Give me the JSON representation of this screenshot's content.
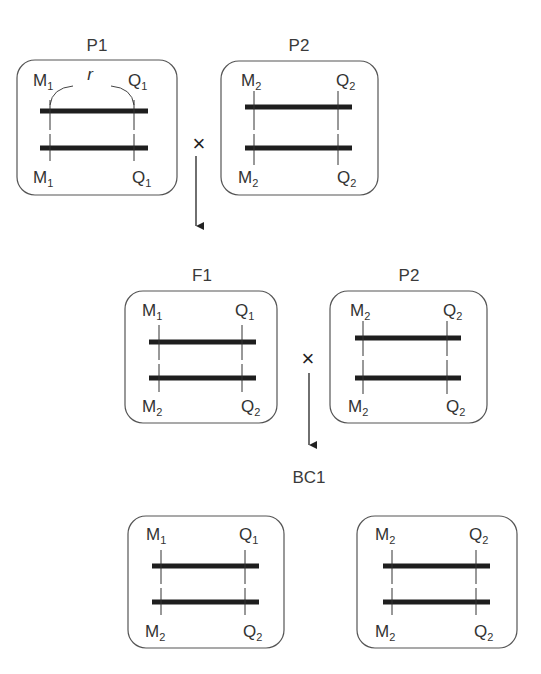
{
  "diagram": {
    "type": "genetic-cross-backcross",
    "cross_symbol": "×",
    "generations": [
      {
        "row": 1,
        "cross": true,
        "individuals": [
          {
            "title": "P1",
            "top_left": {
              "base": "M",
              "sub": "1"
            },
            "top_right": {
              "base": "Q",
              "sub": "1"
            },
            "bottom_left": {
              "base": "M",
              "sub": "1"
            },
            "bottom_right": {
              "base": "Q",
              "sub": "1"
            },
            "recombination_label": "r"
          },
          {
            "title": "P2",
            "top_left": {
              "base": "M",
              "sub": "2"
            },
            "top_right": {
              "base": "Q",
              "sub": "2"
            },
            "bottom_left": {
              "base": "M",
              "sub": "2"
            },
            "bottom_right": {
              "base": "Q",
              "sub": "2"
            }
          }
        ]
      },
      {
        "row": 2,
        "cross": true,
        "individuals": [
          {
            "title": "F1",
            "top_left": {
              "base": "M",
              "sub": "1"
            },
            "top_right": {
              "base": "Q",
              "sub": "1"
            },
            "bottom_left": {
              "base": "M",
              "sub": "2"
            },
            "bottom_right": {
              "base": "Q",
              "sub": "2"
            }
          },
          {
            "title": "P2",
            "top_left": {
              "base": "M",
              "sub": "2"
            },
            "top_right": {
              "base": "Q",
              "sub": "2"
            },
            "bottom_left": {
              "base": "M",
              "sub": "2"
            },
            "bottom_right": {
              "base": "Q",
              "sub": "2"
            }
          }
        ]
      },
      {
        "row": 3,
        "title": "BC1",
        "cross": false,
        "individuals": [
          {
            "top_left": {
              "base": "M",
              "sub": "1"
            },
            "top_right": {
              "base": "Q",
              "sub": "1"
            },
            "bottom_left": {
              "base": "M",
              "sub": "2"
            },
            "bottom_right": {
              "base": "Q",
              "sub": "2"
            }
          },
          {
            "top_left": {
              "base": "M",
              "sub": "2"
            },
            "top_right": {
              "base": "Q",
              "sub": "2"
            },
            "bottom_left": {
              "base": "M",
              "sub": "2"
            },
            "bottom_right": {
              "base": "Q",
              "sub": "2"
            }
          }
        ]
      }
    ]
  }
}
